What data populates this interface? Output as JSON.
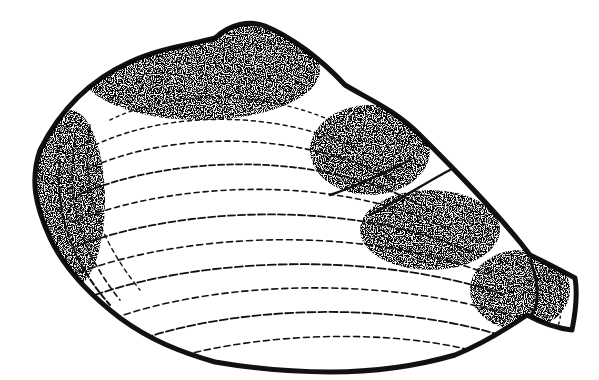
{
  "image": {
    "subject": "clam shell illustration",
    "style": "black ink stipple drawing",
    "colors": {
      "ink": "#111111",
      "background": "#ffffff"
    }
  }
}
